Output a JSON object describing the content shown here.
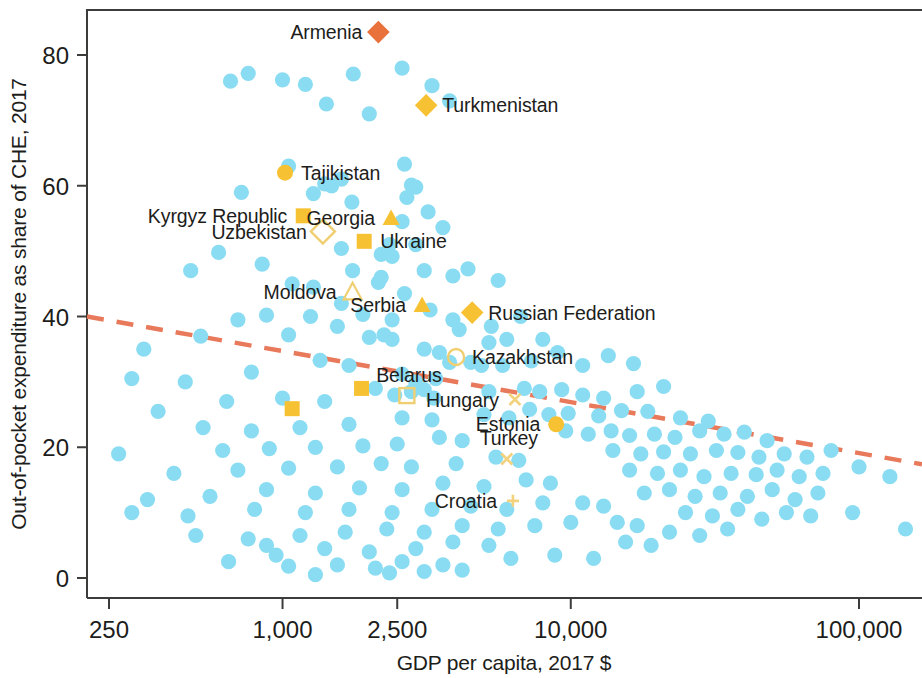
{
  "chart_data": {
    "type": "scatter",
    "title": "",
    "xlabel": "GDP per capita, 2017 $",
    "ylabel": "Out-of-pocket expenditure as share of CHE, 2017",
    "xscale": "log",
    "yscale": "linear",
    "xlim": [
      215,
      175000
    ],
    "ylim": [
      -2,
      86
    ],
    "grid": false,
    "legend": "none",
    "xticks": [
      250,
      1000,
      2500,
      10000,
      100000
    ],
    "xtick_labels": [
      "250",
      "1,000",
      "2,500",
      "10,000",
      "100,000"
    ],
    "yticks": [
      0,
      20,
      40,
      60,
      80
    ],
    "ytick_labels": [
      "0",
      "20",
      "40",
      "60",
      "80"
    ],
    "colors": {
      "generic_point": "#8ADCF2",
      "highlight": "#F7C134",
      "highlight_open": "#F5CE62",
      "armenia": "#E8713C",
      "trendline": "#E8795B",
      "axis": "#3c3c3b",
      "text": "#1d1d1b"
    },
    "trendline": {
      "style": "dashed",
      "x_start": 250,
      "y_start": 40.0,
      "x_end": 170000,
      "y_end": 17.4
    },
    "labeled_series": [
      {
        "name": "Armenia",
        "x": 2150,
        "y": 83.5,
        "marker": "diamond",
        "color": "#E8713C",
        "label_side": "left"
      },
      {
        "name": "Turkmenistan",
        "x": 3150,
        "y": 72.3,
        "marker": "diamond",
        "color": "#F7C134",
        "label_side": "right"
      },
      {
        "name": "Tajikistan",
        "x": 1020,
        "y": 62.0,
        "marker": "circle",
        "color": "#F7C134",
        "label_side": "right"
      },
      {
        "name": "Kyrgyz Republic",
        "x": 1180,
        "y": 55.4,
        "marker": "square",
        "color": "#F7C134",
        "label_side": "left"
      },
      {
        "name": "Uzbekistan",
        "x": 1380,
        "y": 53.0,
        "marker": "diamond-open",
        "color": "#F0CF72",
        "label_side": "left"
      },
      {
        "name": "Georgia",
        "x": 2380,
        "y": 55.0,
        "marker": "triangle",
        "color": "#F7C134",
        "label_side": "left"
      },
      {
        "name": "Ukraine",
        "x": 1920,
        "y": 51.5,
        "marker": "square",
        "color": "#F7C134",
        "label_side": "right"
      },
      {
        "name": "Moldova",
        "x": 1750,
        "y": 43.7,
        "marker": "triangle-open",
        "color": "#F0CF72",
        "label_side": "left"
      },
      {
        "name": "Serbia",
        "x": 3050,
        "y": 41.7,
        "marker": "triangle",
        "color": "#F7C134",
        "label_side": "left"
      },
      {
        "name": "Russian Federation",
        "x": 4550,
        "y": 40.6,
        "marker": "diamond",
        "color": "#F7C134",
        "label_side": "right"
      },
      {
        "name": "Kazakhstan",
        "x": 4000,
        "y": 33.8,
        "marker": "circle-open",
        "color": "#F0CF72",
        "label_side": "right"
      },
      {
        "name": "Belarus",
        "x": 2700,
        "y": 27.9,
        "marker": "square-open",
        "color": "#F0CF72",
        "label_side": "top"
      },
      {
        "name": "Hungary",
        "x": 6400,
        "y": 27.3,
        "marker": "x",
        "color": "#F3D27E",
        "label_side": "left"
      },
      {
        "name": "Estonia",
        "x": 8900,
        "y": 23.5,
        "marker": "circle",
        "color": "#F7C134",
        "label_side": "left"
      },
      {
        "name": "Turkey",
        "x": 6000,
        "y": 18.2,
        "marker": "x",
        "color": "#F3D27E",
        "label_side": "top"
      },
      {
        "name": "Croatia",
        "x": 6300,
        "y": 11.8,
        "marker": "plus",
        "color": "#F3D27E",
        "label_side": "left"
      }
    ],
    "extra_highlight_markers": [
      {
        "x": 1880,
        "y": 29.0,
        "marker": "square",
        "color": "#F7C134"
      },
      {
        "x": 1080,
        "y": 25.9,
        "marker": "square",
        "color": "#F7C134"
      }
    ],
    "points": [
      [
        660,
        76.0
      ],
      [
        760,
        77.2
      ],
      [
        1000,
        76.2
      ],
      [
        1200,
        75.5
      ],
      [
        1760,
        77.1
      ],
      [
        2600,
        78.0
      ],
      [
        1420,
        72.5
      ],
      [
        2000,
        71.0
      ],
      [
        3300,
        75.3
      ],
      [
        3800,
        73.0
      ],
      [
        1050,
        63.0
      ],
      [
        1600,
        61.0
      ],
      [
        1400,
        60.3
      ],
      [
        1480,
        60.0
      ],
      [
        2650,
        63.3
      ],
      [
        2800,
        60.1
      ],
      [
        2900,
        59.8
      ],
      [
        1280,
        58.8
      ],
      [
        720,
        59.0
      ],
      [
        1740,
        57.5
      ],
      [
        2700,
        58.2
      ],
      [
        3200,
        56.0
      ],
      [
        2600,
        54.5
      ],
      [
        3600,
        53.6
      ],
      [
        2350,
        51.0
      ],
      [
        2900,
        51.0
      ],
      [
        1600,
        50.4
      ],
      [
        2200,
        49.5
      ],
      [
        2400,
        49.2
      ],
      [
        600,
        49.8
      ],
      [
        850,
        48.0
      ],
      [
        480,
        47.0
      ],
      [
        1080,
        45.0
      ],
      [
        1280,
        44.5
      ],
      [
        1750,
        47.0
      ],
      [
        2200,
        46.0
      ],
      [
        2150,
        45.2
      ],
      [
        3100,
        47.0
      ],
      [
        3900,
        46.2
      ],
      [
        4400,
        47.3
      ],
      [
        5600,
        45.5
      ],
      [
        880,
        40.2
      ],
      [
        1250,
        40.0
      ],
      [
        1600,
        42.0
      ],
      [
        1900,
        40.3
      ],
      [
        2400,
        39.5
      ],
      [
        3250,
        41.0
      ],
      [
        3900,
        39.5
      ],
      [
        4100,
        38.0
      ],
      [
        5300,
        38.5
      ],
      [
        6700,
        40.0
      ],
      [
        2650,
        43.5
      ],
      [
        700,
        39.5
      ],
      [
        1050,
        37.2
      ],
      [
        1550,
        38.5
      ],
      [
        2000,
        36.8
      ],
      [
        2250,
        37.2
      ],
      [
        2400,
        36.5
      ],
      [
        3100,
        35.0
      ],
      [
        3500,
        34.5
      ],
      [
        5200,
        36.0
      ],
      [
        6000,
        36.5
      ],
      [
        8000,
        36.5
      ],
      [
        520,
        37.0
      ],
      [
        330,
        35.0
      ],
      [
        3800,
        33.0
      ],
      [
        4500,
        33.0
      ],
      [
        4900,
        32.5
      ],
      [
        5800,
        32.5
      ],
      [
        7300,
        33.2
      ],
      [
        9000,
        34.5
      ],
      [
        11000,
        32.5
      ],
      [
        13500,
        34.0
      ],
      [
        16500,
        32.8
      ],
      [
        1350,
        33.3
      ],
      [
        1700,
        32.5
      ],
      [
        2600,
        31.2
      ],
      [
        3400,
        30.5
      ],
      [
        2900,
        30.0
      ],
      [
        780,
        31.5
      ],
      [
        460,
        30.0
      ],
      [
        300,
        30.5
      ],
      [
        2100,
        29.0
      ],
      [
        2450,
        28.0
      ],
      [
        2800,
        28.5
      ],
      [
        3100,
        28.8
      ],
      [
        3350,
        27.5
      ],
      [
        5200,
        28.5
      ],
      [
        6900,
        29.0
      ],
      [
        7800,
        28.5
      ],
      [
        9300,
        28.8
      ],
      [
        11000,
        28.0
      ],
      [
        13000,
        27.5
      ],
      [
        17000,
        28.5
      ],
      [
        21000,
        29.3
      ],
      [
        1400,
        27.0
      ],
      [
        1000,
        27.5
      ],
      [
        640,
        27.0
      ],
      [
        370,
        25.5
      ],
      [
        5000,
        25.0
      ],
      [
        6100,
        24.5
      ],
      [
        7200,
        25.8
      ],
      [
        8400,
        25.0
      ],
      [
        9800,
        25.2
      ],
      [
        12500,
        24.8
      ],
      [
        15000,
        25.6
      ],
      [
        18500,
        25.5
      ],
      [
        24000,
        24.5
      ],
      [
        30000,
        24.0
      ],
      [
        2600,
        24.5
      ],
      [
        3300,
        24.2
      ],
      [
        1700,
        23.5
      ],
      [
        1150,
        23.0
      ],
      [
        780,
        22.5
      ],
      [
        530,
        23.0
      ],
      [
        9600,
        22.5
      ],
      [
        11500,
        22.0
      ],
      [
        13800,
        22.5
      ],
      [
        16000,
        21.8
      ],
      [
        19500,
        22.0
      ],
      [
        23000,
        21.5
      ],
      [
        28000,
        22.5
      ],
      [
        34000,
        22.0
      ],
      [
        40000,
        22.3
      ],
      [
        48000,
        21.0
      ],
      [
        3500,
        21.5
      ],
      [
        4200,
        21.0
      ],
      [
        2500,
        20.5
      ],
      [
        1900,
        20.2
      ],
      [
        1300,
        20.0
      ],
      [
        900,
        19.8
      ],
      [
        620,
        19.5
      ],
      [
        270,
        19.0
      ],
      [
        14000,
        19.5
      ],
      [
        17500,
        19.0
      ],
      [
        21000,
        19.3
      ],
      [
        26000,
        19.0
      ],
      [
        32000,
        19.5
      ],
      [
        38000,
        19.2
      ],
      [
        45000,
        18.5
      ],
      [
        55000,
        19.0
      ],
      [
        66000,
        18.5
      ],
      [
        80000,
        19.5
      ],
      [
        5500,
        18.5
      ],
      [
        6600,
        18.0
      ],
      [
        4000,
        17.5
      ],
      [
        2800,
        17.0
      ],
      [
        2200,
        17.5
      ],
      [
        1550,
        17.0
      ],
      [
        1050,
        16.8
      ],
      [
        700,
        16.5
      ],
      [
        420,
        16.0
      ],
      [
        16000,
        16.5
      ],
      [
        20000,
        16.0
      ],
      [
        24000,
        16.5
      ],
      [
        29000,
        15.5
      ],
      [
        36000,
        16.0
      ],
      [
        44000,
        15.8
      ],
      [
        52000,
        16.5
      ],
      [
        62000,
        15.5
      ],
      [
        75000,
        16.0
      ],
      [
        100000,
        17.0
      ],
      [
        128000,
        15.5
      ],
      [
        7000,
        15.0
      ],
      [
        8500,
        14.5
      ],
      [
        5000,
        14.0
      ],
      [
        3600,
        14.5
      ],
      [
        2600,
        13.5
      ],
      [
        1850,
        13.8
      ],
      [
        1300,
        13.0
      ],
      [
        880,
        13.5
      ],
      [
        560,
        12.5
      ],
      [
        340,
        12.0
      ],
      [
        18000,
        13.0
      ],
      [
        22000,
        13.5
      ],
      [
        27000,
        12.5
      ],
      [
        33000,
        13.0
      ],
      [
        41000,
        12.5
      ],
      [
        50000,
        13.5
      ],
      [
        60000,
        12.0
      ],
      [
        72000,
        13.0
      ],
      [
        11000,
        11.5
      ],
      [
        13000,
        11.0
      ],
      [
        8000,
        11.5
      ],
      [
        6000,
        10.5
      ],
      [
        4500,
        11.0
      ],
      [
        3300,
        10.5
      ],
      [
        2400,
        10.0
      ],
      [
        1700,
        10.5
      ],
      [
        1200,
        10.0
      ],
      [
        800,
        10.5
      ],
      [
        470,
        9.5
      ],
      [
        300,
        10.0
      ],
      [
        25000,
        10.0
      ],
      [
        31000,
        9.5
      ],
      [
        38000,
        10.5
      ],
      [
        46000,
        9.0
      ],
      [
        56000,
        10.0
      ],
      [
        68000,
        9.5
      ],
      [
        95000,
        10.0
      ],
      [
        145000,
        7.5
      ],
      [
        14500,
        8.5
      ],
      [
        17000,
        8.0
      ],
      [
        10000,
        8.5
      ],
      [
        7500,
        8.0
      ],
      [
        5600,
        7.5
      ],
      [
        4200,
        8.0
      ],
      [
        3100,
        7.0
      ],
      [
        2300,
        7.5
      ],
      [
        1650,
        7.0
      ],
      [
        1150,
        6.5
      ],
      [
        760,
        6.0
      ],
      [
        500,
        6.5
      ],
      [
        22000,
        7.0
      ],
      [
        28000,
        6.5
      ],
      [
        35000,
        7.5
      ],
      [
        3900,
        5.5
      ],
      [
        5200,
        5.0
      ],
      [
        2900,
        4.5
      ],
      [
        2000,
        4.0
      ],
      [
        1400,
        4.5
      ],
      [
        950,
        3.5
      ],
      [
        15500,
        5.5
      ],
      [
        19000,
        5.0
      ],
      [
        2100,
        1.5
      ],
      [
        2350,
        0.8
      ],
      [
        1300,
        0.5
      ],
      [
        3100,
        1.0
      ],
      [
        4200,
        1.2
      ],
      [
        3600,
        2.0
      ],
      [
        2600,
        2.5
      ],
      [
        6200,
        3.0
      ],
      [
        8800,
        3.5
      ],
      [
        12000,
        3.0
      ],
      [
        1550,
        2.0
      ],
      [
        1050,
        1.8
      ],
      [
        650,
        2.5
      ],
      [
        880,
        5.0
      ]
    ]
  }
}
